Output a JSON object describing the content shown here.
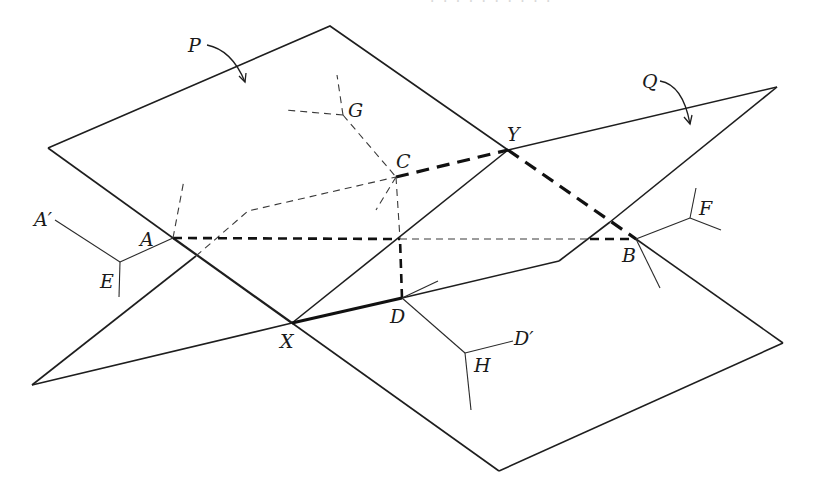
{
  "figure": {
    "planes": [
      {
        "name": "P",
        "label": "P"
      },
      {
        "name": "Q",
        "label": "Q"
      }
    ],
    "points": {
      "A": "A",
      "A_prime": "A′",
      "B": "B",
      "C": "C",
      "D": "D",
      "D_prime": "D′",
      "E": "E",
      "F": "F",
      "G": "G",
      "H": "H",
      "X": "X",
      "Y": "Y"
    },
    "header_fragment": "· · · · · · · · · ·",
    "line_styles": {
      "visible_edge": "solid",
      "hidden_edge": "thin dashed",
      "path_visible": "heavy solid",
      "path_hidden": "heavy dashed"
    },
    "colors": {
      "ink": "#1e1e1e",
      "background": "#ffffff"
    }
  }
}
